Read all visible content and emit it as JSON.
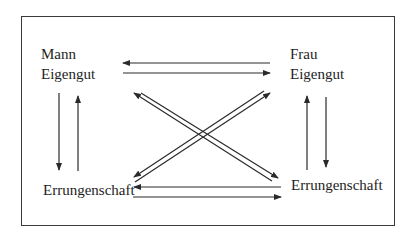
{
  "diagram": {
    "nodes": [
      {
        "id": "mann_eigengut",
        "lines": [
          "Mann",
          "Eigengut"
        ]
      },
      {
        "id": "frau_eigengut",
        "lines": [
          "Frau",
          "Eigengut"
        ]
      },
      {
        "id": "mann_errungenschaft",
        "lines": [
          "Errungenschaft"
        ]
      },
      {
        "id": "frau_errungenschaft",
        "lines": [
          "Errungenschaft"
        ]
      }
    ],
    "edges": [
      {
        "from": "frau_eigengut",
        "to": "mann_eigengut"
      },
      {
        "from": "mann_eigengut",
        "to": "frau_eigengut"
      },
      {
        "from": "mann_eigengut",
        "to": "mann_errungenschaft"
      },
      {
        "from": "mann_errungenschaft",
        "to": "mann_eigengut"
      },
      {
        "from": "frau_eigengut",
        "to": "frau_errungenschaft"
      },
      {
        "from": "frau_errungenschaft",
        "to": "frau_eigengut"
      },
      {
        "from": "frau_errungenschaft",
        "to": "mann_errungenschaft"
      },
      {
        "from": "mann_errungenschaft",
        "to": "frau_errungenschaft"
      },
      {
        "from": "frau_errungenschaft",
        "to": "mann_eigengut"
      },
      {
        "from": "mann_eigengut",
        "to": "frau_errungenschaft"
      },
      {
        "from": "mann_errungenschaft",
        "to": "frau_eigengut"
      },
      {
        "from": "frau_eigengut",
        "to": "mann_errungenschaft"
      }
    ],
    "colors": {
      "line": "#2a2a2a",
      "border": "#3a3a3a",
      "text": "#1e1e1e"
    }
  }
}
